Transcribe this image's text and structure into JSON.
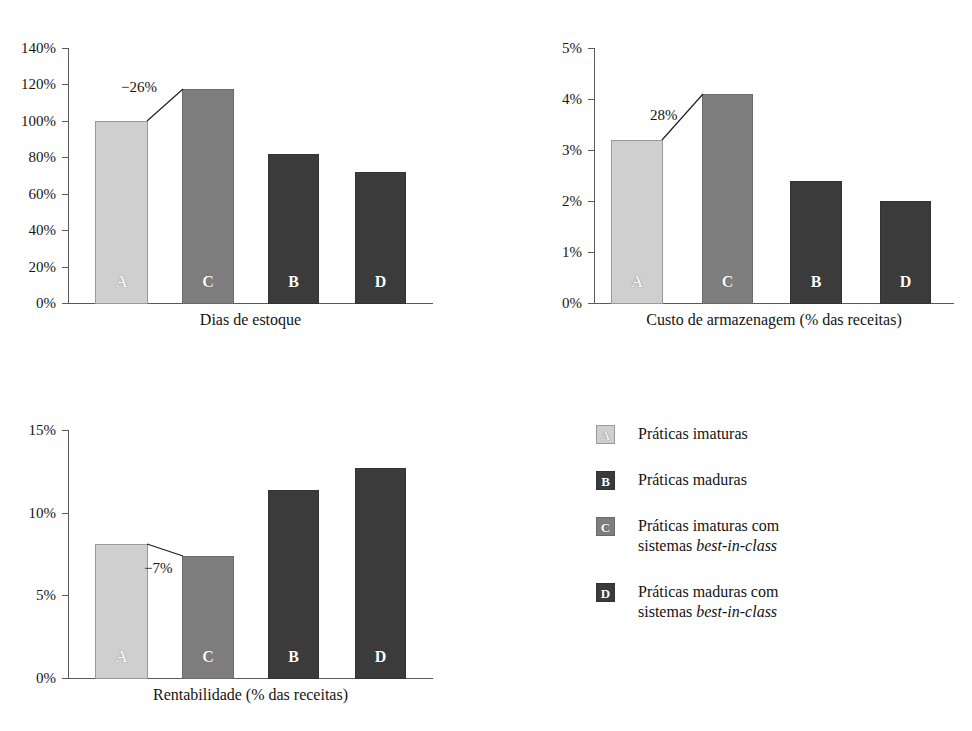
{
  "chart_data": [
    {
      "id": "dias-de-estoque",
      "type": "bar",
      "title": "",
      "xlabel": "Dias de estoque",
      "ylabel": "",
      "categories": [
        "A",
        "C",
        "B",
        "D"
      ],
      "values": [
        100,
        117.5,
        82,
        72
      ],
      "ytick_labels": [
        "0%",
        "20%",
        "40%",
        "60%",
        "80%",
        "100%",
        "120%",
        "140%"
      ],
      "yticks": [
        0,
        20,
        40,
        60,
        80,
        100,
        120,
        140
      ],
      "ylim": [
        0,
        140
      ],
      "grid": false,
      "annotation": {
        "text": "−26%",
        "from": "A",
        "to": "C"
      }
    },
    {
      "id": "custo-de-armazenagem",
      "type": "bar",
      "title": "",
      "xlabel": "Custo de armazenagem (% das receitas)",
      "ylabel": "",
      "categories": [
        "A",
        "C",
        "B",
        "D"
      ],
      "values": [
        3.2,
        4.1,
        2.4,
        2.0
      ],
      "ytick_labels": [
        "0%",
        "1%",
        "2%",
        "3%",
        "4%",
        "5%"
      ],
      "yticks": [
        0,
        1,
        2,
        3,
        4,
        5
      ],
      "ylim": [
        0,
        5
      ],
      "grid": false,
      "annotation": {
        "text": "28%",
        "from": "A",
        "to": "C"
      }
    },
    {
      "id": "rentabilidade",
      "type": "bar",
      "title": "",
      "xlabel": "Rentabilidade (% das receitas)",
      "ylabel": "",
      "categories": [
        "A",
        "C",
        "B",
        "D"
      ],
      "values": [
        8.1,
        7.4,
        11.4,
        12.7
      ],
      "ytick_labels": [
        "0%",
        "5%",
        "10%",
        "15%"
      ],
      "yticks": [
        0,
        5,
        10,
        15
      ],
      "ylim": [
        0,
        15
      ],
      "grid": false,
      "annotation": {
        "text": "−7%",
        "from": "A",
        "to": "C"
      }
    }
  ],
  "legend": {
    "position": "bottom-right",
    "items": [
      {
        "key": "A",
        "label": "Práticas imaturas",
        "color": "#cfcfcf"
      },
      {
        "key": "B",
        "label": "Práticas maduras",
        "color": "#3b3b3b"
      },
      {
        "key": "C",
        "label": "Práticas imaturas com\nsistemas best-in-class",
        "color": "#7e7e7e",
        "italic_part": "best-in-class"
      },
      {
        "key": "D",
        "label": "Práticas maduras com\nsistemas best-in-class",
        "color": "#3b3b3b",
        "italic_part": "best-in-class"
      }
    ]
  }
}
